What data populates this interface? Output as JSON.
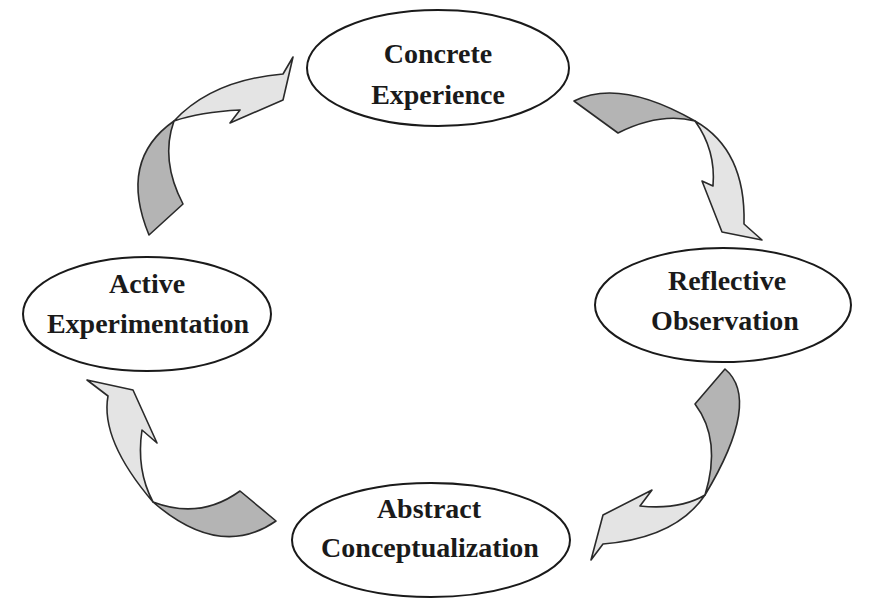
{
  "diagram": {
    "type": "cycle",
    "nodes": [
      {
        "id": "concrete_experience",
        "line1": "Concrete",
        "line2": "Experience",
        "position": "top"
      },
      {
        "id": "reflective_observation",
        "line1": "Reflective",
        "line2": "Observation",
        "position": "right"
      },
      {
        "id": "abstract_conceptualization",
        "line1": "Abstract",
        "line2": "Conceptualization",
        "position": "bottom"
      },
      {
        "id": "active_experimentation",
        "line1": "Active",
        "line2": "Experimentation",
        "position": "left"
      }
    ],
    "edges": [
      {
        "from": "concrete_experience",
        "to": "reflective_observation",
        "direction": "clockwise"
      },
      {
        "from": "reflective_observation",
        "to": "abstract_conceptualization",
        "direction": "clockwise"
      },
      {
        "from": "abstract_conceptualization",
        "to": "active_experimentation",
        "direction": "clockwise"
      },
      {
        "from": "active_experimentation",
        "to": "concrete_experience",
        "direction": "clockwise"
      }
    ],
    "colors": {
      "arrow_tail": "#b4b4b4",
      "arrow_head": "#e4e4e4",
      "outline": "#1a1a1a",
      "background": "#ffffff"
    }
  }
}
